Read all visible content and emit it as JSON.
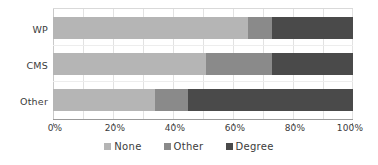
{
  "chart_data": {
    "type": "bar",
    "orientation": "horizontal",
    "stacked": true,
    "normalized_percent": true,
    "title": "",
    "subtitle": "",
    "xlabel": "",
    "ylabel": "",
    "categories": [
      "WP",
      "CMS",
      "Other"
    ],
    "xtick_labels": [
      "0%",
      "20%",
      "40%",
      "60%",
      "80%",
      "100%"
    ],
    "xtick_values": [
      0,
      20,
      40,
      60,
      80,
      100
    ],
    "xlim": [
      0,
      100
    ],
    "grid": "vertical-light",
    "legend_position": "bottom-center",
    "series": [
      {
        "name": "None",
        "color": "#b5b5b5",
        "values": [
          65,
          51,
          34
        ]
      },
      {
        "name": "Other",
        "color": "#8a8a8a",
        "values": [
          8,
          22,
          11
        ]
      },
      {
        "name": "Degree",
        "color": "#4a4a4a",
        "values": [
          27,
          27,
          55
        ]
      }
    ],
    "legend": [
      {
        "label": "None",
        "color": "#b5b5b5",
        "icon": "square-swatch-icon"
      },
      {
        "label": "Other",
        "color": "#8a8a8a",
        "icon": "square-swatch-icon"
      },
      {
        "label": "Degree",
        "color": "#4a4a4a",
        "icon": "square-swatch-icon"
      }
    ]
  },
  "colors": {
    "none": "#b5b5b5",
    "other": "#8a8a8a",
    "degree": "#4a4a4a",
    "axis": "#9a9a9a",
    "gridline": "#e2e2e2",
    "text": "#3b3b3b",
    "background": "#ffffff"
  }
}
